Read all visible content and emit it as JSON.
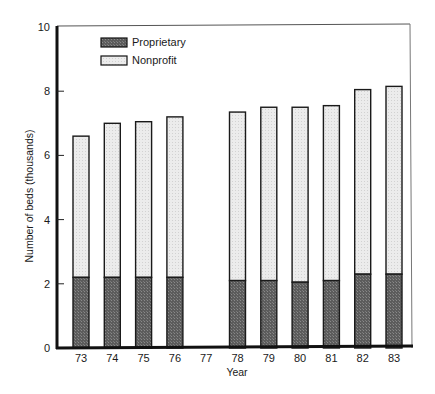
{
  "chart_data": {
    "type": "bar",
    "stacked": true,
    "title": "",
    "xlabel": "Year",
    "ylabel": "Number of beds (thousands)",
    "ylim": [
      0,
      10
    ],
    "yticks": [
      0,
      2,
      4,
      6,
      8,
      10
    ],
    "grid": false,
    "legend_position": "upper left (inside plot)",
    "categories": [
      "73",
      "74",
      "75",
      "76",
      "77",
      "78",
      "79",
      "80",
      "81",
      "82",
      "83"
    ],
    "series": [
      {
        "name": "Proprietary",
        "color": "#6b6b6b",
        "pattern": "dark stipple",
        "values": [
          2.2,
          2.2,
          2.2,
          2.2,
          null,
          2.1,
          2.1,
          2.05,
          2.1,
          2.3,
          2.3
        ]
      },
      {
        "name": "Nonprofit",
        "color": "#e6e6e6",
        "pattern": "light stipple",
        "values": [
          4.4,
          4.8,
          4.85,
          5.0,
          null,
          5.25,
          5.4,
          5.45,
          5.45,
          5.75,
          5.85
        ]
      }
    ],
    "totals": [
      6.6,
      7.0,
      7.05,
      7.2,
      null,
      7.35,
      7.5,
      7.5,
      7.55,
      8.05,
      8.15
    ],
    "annotations": [
      "No bar shown for year 77"
    ]
  },
  "legend": {
    "items": [
      {
        "label": "Proprietary"
      },
      {
        "label": "Nonprofit"
      }
    ]
  },
  "axes": {
    "x_label": "Year",
    "y_label": "Number of beds (thousands)",
    "y_ticks": [
      "0",
      "2",
      "4",
      "6",
      "8",
      "10"
    ],
    "x_ticks": [
      "73",
      "74",
      "75",
      "76",
      "77",
      "78",
      "79",
      "80",
      "81",
      "82",
      "83"
    ]
  }
}
